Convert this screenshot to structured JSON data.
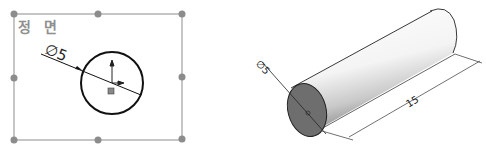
{
  "sketch_view": {
    "label": "정 면",
    "diameter_label": "∅5",
    "frame_color": "#9a9a9a",
    "handle_color": "#8c8c8c",
    "circle_color": "#111111"
  },
  "iso_view": {
    "diameter_label": "∅5",
    "length_label": "15",
    "face_color": "#6e6e6e",
    "edge_color": "#222222"
  }
}
